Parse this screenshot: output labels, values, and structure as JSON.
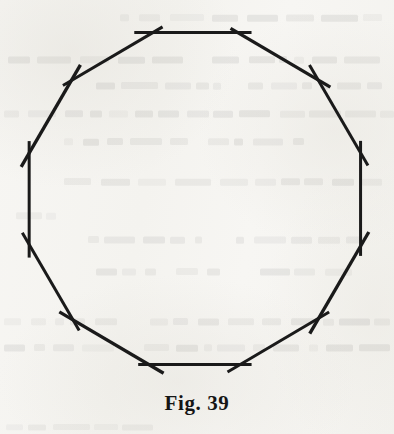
{
  "figure": {
    "caption": "Fig. 39",
    "kind": "regular-dodecagon",
    "sides": 12,
    "stroke_color": "#1a1a1a",
    "paper_color": "#f6f5f2",
    "caption_color": "#151515"
  },
  "chart_data": {
    "type": "scatter",
    "title": "Fig. 39",
    "xlabel": "",
    "ylabel": "",
    "grid": false,
    "legend": null,
    "xlim": [
      0,
      394
    ],
    "ylim": [
      0,
      434
    ],
    "geometry": {
      "shape": "regular polygon",
      "n_sides": 12,
      "center_x": 195,
      "center_y": 199,
      "circumradius": 172,
      "start_angle_deg": -75,
      "overshoot_px": 13,
      "stroke_width_px": 3
    },
    "vertices": [
      {
        "index": 1,
        "label": "A",
        "x": 239.5,
        "y": 32.9
      },
      {
        "index": 2,
        "label": "B",
        "x": 316.9,
        "y": 78.5
      },
      {
        "index": 3,
        "label": "C",
        "x": 361.1,
        "y": 154.5
      },
      {
        "index": 4,
        "label": "D",
        "x": 361.1,
        "y": 243.5
      },
      {
        "index": 5,
        "label": "E",
        "x": 316.9,
        "y": 319.5
      },
      {
        "index": 6,
        "label": "F",
        "x": 239.5,
        "y": 365.1
      },
      {
        "index": 7,
        "label": "G",
        "x": 150.5,
        "y": 365.1
      },
      {
        "index": 8,
        "label": "H",
        "x": 73.1,
        "y": 319.5
      },
      {
        "index": 9,
        "label": "I",
        "x": 28.9,
        "y": 243.5
      },
      {
        "index": 10,
        "label": "J",
        "x": 28.9,
        "y": 154.5
      },
      {
        "index": 11,
        "label": "K",
        "x": 73.1,
        "y": 78.5
      },
      {
        "index": 12,
        "label": "L",
        "x": 150.5,
        "y": 32.9
      }
    ],
    "edges": [
      {
        "from": "A",
        "to": "B"
      },
      {
        "from": "B",
        "to": "C"
      },
      {
        "from": "C",
        "to": "D"
      },
      {
        "from": "D",
        "to": "E"
      },
      {
        "from": "E",
        "to": "F"
      },
      {
        "from": "F",
        "to": "G"
      },
      {
        "from": "G",
        "to": "H"
      },
      {
        "from": "H",
        "to": "I"
      },
      {
        "from": "I",
        "to": "J"
      },
      {
        "from": "J",
        "to": "K"
      },
      {
        "from": "K",
        "to": "L"
      },
      {
        "from": "L",
        "to": "A"
      }
    ]
  },
  "bleed_through": {
    "note": "faint mirrored text showing through from the reverse side of the page",
    "lines": [
      {
        "x": 120,
        "y": 14,
        "width": 262,
        "height": 7
      },
      {
        "x": 8,
        "y": 56,
        "width": 180,
        "height": 7
      },
      {
        "x": 212,
        "y": 56,
        "width": 170,
        "height": 7
      },
      {
        "x": 96,
        "y": 82,
        "width": 130,
        "height": 7
      },
      {
        "x": 248,
        "y": 82,
        "width": 134,
        "height": 7
      },
      {
        "x": 4,
        "y": 110,
        "width": 390,
        "height": 7
      },
      {
        "x": 64,
        "y": 138,
        "width": 124,
        "height": 7
      },
      {
        "x": 208,
        "y": 138,
        "width": 96,
        "height": 7
      },
      {
        "x": 64,
        "y": 178,
        "width": 318,
        "height": 7
      },
      {
        "x": 16,
        "y": 212,
        "width": 40,
        "height": 7
      },
      {
        "x": 88,
        "y": 236,
        "width": 114,
        "height": 7
      },
      {
        "x": 236,
        "y": 236,
        "width": 128,
        "height": 7
      },
      {
        "x": 96,
        "y": 268,
        "width": 60,
        "height": 7
      },
      {
        "x": 176,
        "y": 268,
        "width": 44,
        "height": 7
      },
      {
        "x": 260,
        "y": 268,
        "width": 92,
        "height": 7
      },
      {
        "x": 4,
        "y": 318,
        "width": 120,
        "height": 7
      },
      {
        "x": 150,
        "y": 318,
        "width": 240,
        "height": 7
      },
      {
        "x": 4,
        "y": 344,
        "width": 110,
        "height": 7
      },
      {
        "x": 144,
        "y": 344,
        "width": 246,
        "height": 7
      },
      {
        "x": 6,
        "y": 424,
        "width": 150,
        "height": 6
      }
    ]
  }
}
